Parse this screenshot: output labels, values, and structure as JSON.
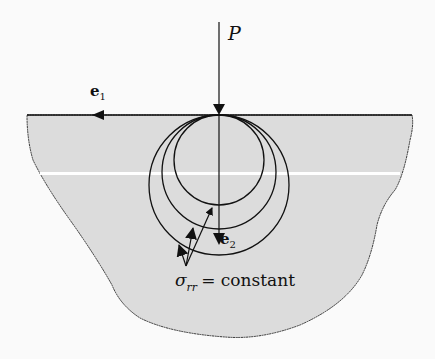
{
  "figure": {
    "colors": {
      "body_fill": "#dcdcdc",
      "outline": "#333333",
      "lines": "#111111",
      "background": "#fafafa"
    },
    "labels": {
      "load": "P",
      "e1_base": "e",
      "e1_sub": "1",
      "e2_base": "e",
      "e2_sub": "2",
      "sigma_symbol": "σ",
      "sigma_sub": "rr",
      "sigma_rest": "= constant"
    },
    "geometry": {
      "surface_y": 115,
      "load_x": 219,
      "circles": [
        {
          "name": "small",
          "cx": 219,
          "cy": 160,
          "r": 45
        },
        {
          "name": "medium",
          "cx": 219,
          "cy": 171,
          "r": 57
        },
        {
          "name": "large",
          "cx": 219,
          "cy": 185,
          "r": 70
        }
      ]
    }
  }
}
